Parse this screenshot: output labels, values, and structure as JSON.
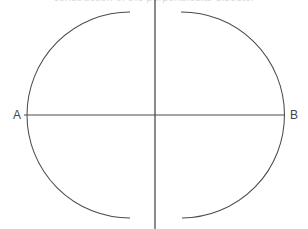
{
  "figure": {
    "background_color": "#ffffff",
    "stroke_color": "#4a4a52",
    "width": 308,
    "height": 229,
    "clipped_caption_text": "construction of the perpendicular bisector",
    "labels": {
      "left_endpoint": "A",
      "right_endpoint": "B"
    }
  },
  "chart_data": {
    "type": "diagram",
    "title": "",
    "elements": [
      {
        "name": "segment-ab",
        "kind": "line",
        "x1": 24,
        "y1": 115,
        "x2": 285,
        "y2": 115,
        "label_start": "A",
        "label_end": "B"
      },
      {
        "name": "perpendicular-bisector",
        "kind": "line",
        "x1": 155,
        "y1": 0,
        "x2": 155,
        "y2": 229
      },
      {
        "name": "left-compass-arc",
        "kind": "arc",
        "center_x": 196,
        "center_y": 115,
        "radius": 60,
        "start_x": 130,
        "start_y": 12,
        "end_x": 130,
        "end_y": 218
      },
      {
        "name": "right-compass-arc",
        "kind": "arc",
        "center_x": 114,
        "center_y": 115,
        "radius": 60,
        "start_x": 181,
        "start_y": 12,
        "end_x": 182,
        "end_y": 218
      }
    ],
    "intersection_points": [
      {
        "name": "upper-arc-intersection",
        "x": 155,
        "y": 43
      },
      {
        "name": "lower-arc-intersection",
        "x": 155,
        "y": 190
      },
      {
        "name": "midpoint-of-ab",
        "x": 155,
        "y": 115
      }
    ],
    "axis_ranges": {
      "x": [
        0,
        308
      ],
      "y": [
        0,
        229
      ]
    },
    "grid": false,
    "legend": false
  }
}
